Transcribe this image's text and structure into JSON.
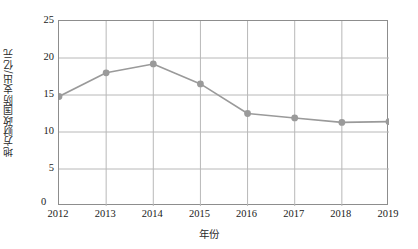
{
  "chart_data": {
    "type": "line",
    "title": "",
    "xlabel": "年份",
    "ylabel": "地方财政国防支出/亿元",
    "categories": [
      "2012",
      "2013",
      "2014",
      "2015",
      "2016",
      "2017",
      "2018",
      "2019"
    ],
    "values": [
      14.8,
      18.0,
      19.2,
      16.5,
      12.5,
      11.9,
      11.3,
      11.4
    ],
    "series": [
      {
        "name": "地方财政国防支出",
        "values": [
          14.8,
          18.0,
          19.2,
          16.5,
          12.5,
          11.9,
          11.3,
          11.4
        ]
      }
    ],
    "ylim": [
      0,
      25
    ],
    "yticks": [
      "0",
      "5",
      "10",
      "15",
      "20",
      "25"
    ],
    "ytick_values": [
      0,
      5,
      10,
      15,
      20,
      25
    ],
    "xticks": [
      "2012",
      "2013",
      "2014",
      "2015",
      "2016",
      "2017",
      "2018",
      "2019"
    ],
    "grid": true,
    "legend": false,
    "legend_position": "none",
    "origin_label": "0",
    "marker": "circle",
    "colors": {
      "series_line": "#9a9a9a",
      "marker": "#9a9a9a",
      "gridline": "#b8b8b8",
      "axis_border": "#8d8d8d",
      "text": "#1a1a1a",
      "background": "#ffffff"
    }
  }
}
